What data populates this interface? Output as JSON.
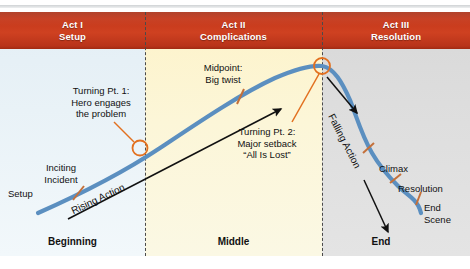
{
  "diagram": {
    "colors": {
      "banner_red": "#c4371a",
      "act1_zone": "#e7f1f7",
      "act2_zone": "#fcf6d8",
      "act3_zone": "#dedede",
      "story_curve": "#5b8fc0",
      "turning_point": "#e2701f",
      "tick_mark": "#c4703a",
      "arrow": "#111111",
      "divider": "#4a4a4a"
    },
    "acts": [
      {
        "name": "Act I",
        "subtitle": "Setup"
      },
      {
        "name": "Act II",
        "subtitle": "Complications"
      },
      {
        "name": "Act III",
        "subtitle": "Resolution"
      }
    ],
    "phases": [
      {
        "label": "Beginning"
      },
      {
        "label": "Middle"
      },
      {
        "label": "End"
      }
    ],
    "beats": {
      "setup": "Setup",
      "inciting_incident_l1": "Inciting",
      "inciting_incident_l2": "Incident",
      "turning_point_1_l1": "Turning Pt. 1:",
      "turning_point_1_l2": "Hero engages",
      "turning_point_1_l3": "the problem",
      "midpoint_l1": "Midpoint:",
      "midpoint_l2": "Big twist",
      "turning_point_2_l1": "Turning Pt. 2:",
      "turning_point_2_l2": "Major setback",
      "turning_point_2_l3": "“All Is Lost”",
      "climax": "Climax",
      "resolution": "Resolution",
      "end_scene_l1": "End",
      "end_scene_l2": "Scene"
    },
    "action_labels": {
      "rising": "Rising Action",
      "falling": "Falling Action"
    }
  }
}
